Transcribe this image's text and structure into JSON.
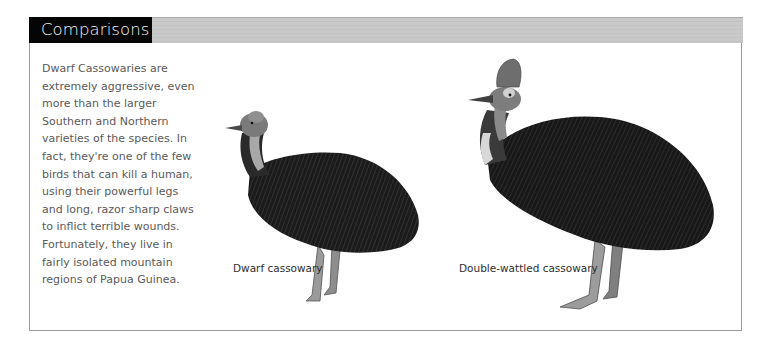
{
  "section": {
    "title": "Comparisons"
  },
  "body": {
    "lines": [
      "Dwarf Cassowaries are",
      "extremely aggressive, even",
      "more than the larger",
      "Southern and Northern",
      "varieties of the species. In",
      "fact, they're one of the few",
      "birds that can kill a human,",
      "using their powerful legs",
      "and long, razor sharp claws",
      "to inflict terrible wounds.",
      "Fortunately, they live in",
      "fairly isolated mountain",
      "regions of Papua Guinea."
    ]
  },
  "illustrations": [
    {
      "name": "dwarf-cassowary",
      "caption": "Dwarf cassowary"
    },
    {
      "name": "double-wattled-cassowary",
      "caption": "Double-wattled cassowary"
    }
  ],
  "colors": {
    "title_bg": "#050505",
    "title_text": "#f4f4f4",
    "header_bar": "#c9c9c9",
    "body_text": "#5a5a5a",
    "border": "#9a9a9a"
  }
}
